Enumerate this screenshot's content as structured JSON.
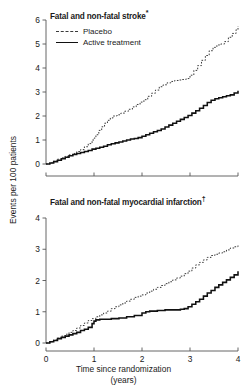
{
  "figure": {
    "y_axis_label": "Events per 100 patients",
    "x_axis_label_line1": "Time since randomization",
    "x_axis_label_line2": "(years)",
    "legend": {
      "placebo_label": "Placebo",
      "active_label": "Active treatment"
    },
    "colors": {
      "placebo": "#3a3a3a",
      "active": "#111111",
      "axis": "#555555",
      "text": "#1a1a1a"
    }
  },
  "chart_data": [
    {
      "type": "line",
      "panel": "top",
      "title": "Fatal and non-fatal stroke*",
      "title_text": "Fatal and non-fatal stroke",
      "title_superscript": "*",
      "xlabel": "Time since randomization (years)",
      "ylabel": "Events per 100 patients",
      "xlim": [
        0,
        4
      ],
      "ylim": [
        0,
        6
      ],
      "xticks": [
        0,
        1,
        2,
        3,
        4
      ],
      "xticklabels": [
        "0",
        "1",
        "2",
        "3",
        "4"
      ],
      "yticks": [
        0,
        1,
        2,
        3,
        4,
        5,
        6
      ],
      "yticklabels": [
        "0",
        "1",
        "2",
        "3",
        "4",
        "5",
        "6"
      ],
      "grid": false,
      "legend_position": "top-left",
      "step_style": "post",
      "series": [
        {
          "name": "Placebo",
          "style": "dashed",
          "x": [
            0.0,
            0.08,
            0.16,
            0.24,
            0.32,
            0.4,
            0.48,
            0.56,
            0.64,
            0.72,
            0.8,
            0.88,
            0.96,
            1.0,
            1.04,
            1.1,
            1.16,
            1.22,
            1.28,
            1.34,
            1.4,
            1.48,
            1.56,
            1.64,
            1.72,
            1.8,
            1.88,
            1.96,
            2.04,
            2.12,
            2.2,
            2.28,
            2.36,
            2.44,
            2.52,
            2.6,
            2.68,
            2.76,
            2.84,
            2.92,
            3.0,
            3.08,
            3.16,
            3.24,
            3.32,
            3.4,
            3.48,
            3.56,
            3.64,
            3.72,
            3.8,
            3.88,
            3.96,
            4.0
          ],
          "y": [
            0.0,
            0.05,
            0.12,
            0.2,
            0.26,
            0.32,
            0.38,
            0.44,
            0.52,
            0.6,
            0.72,
            0.85,
            1.0,
            1.08,
            1.22,
            1.4,
            1.55,
            1.7,
            1.82,
            1.92,
            2.0,
            2.05,
            2.12,
            2.2,
            2.28,
            2.38,
            2.48,
            2.58,
            2.68,
            2.82,
            2.95,
            3.08,
            3.22,
            3.3,
            3.38,
            3.44,
            3.48,
            3.5,
            3.52,
            3.56,
            3.7,
            3.9,
            4.1,
            4.32,
            4.52,
            4.72,
            4.86,
            4.96,
            5.0,
            5.1,
            5.28,
            5.44,
            5.6,
            5.75
          ]
        },
        {
          "name": "Active treatment",
          "style": "solid",
          "x": [
            0.0,
            0.08,
            0.16,
            0.24,
            0.32,
            0.4,
            0.48,
            0.56,
            0.64,
            0.72,
            0.8,
            0.88,
            0.96,
            1.04,
            1.12,
            1.2,
            1.28,
            1.36,
            1.44,
            1.52,
            1.6,
            1.68,
            1.76,
            1.84,
            1.92,
            2.0,
            2.08,
            2.16,
            2.24,
            2.32,
            2.4,
            2.48,
            2.56,
            2.64,
            2.72,
            2.8,
            2.88,
            2.96,
            3.04,
            3.12,
            3.2,
            3.28,
            3.36,
            3.44,
            3.52,
            3.6,
            3.68,
            3.76,
            3.84,
            3.92,
            4.0
          ],
          "y": [
            0.0,
            0.04,
            0.1,
            0.16,
            0.22,
            0.28,
            0.34,
            0.4,
            0.44,
            0.48,
            0.52,
            0.56,
            0.62,
            0.66,
            0.7,
            0.74,
            0.8,
            0.84,
            0.88,
            0.92,
            0.96,
            1.0,
            1.04,
            1.06,
            1.1,
            1.16,
            1.22,
            1.28,
            1.34,
            1.4,
            1.46,
            1.54,
            1.62,
            1.7,
            1.78,
            1.86,
            1.94,
            2.02,
            2.12,
            2.22,
            2.32,
            2.44,
            2.56,
            2.66,
            2.72,
            2.76,
            2.8,
            2.84,
            2.88,
            2.96,
            3.05
          ]
        }
      ]
    },
    {
      "type": "line",
      "panel": "bottom",
      "title": "Fatal and non-fatal myocardial infarction†",
      "title_text": "Fatal and non-fatal myocardial infarction",
      "title_superscript": "†",
      "xlabel": "Time since randomization (years)",
      "ylabel": "Events per 100 patients",
      "xlim": [
        0,
        4
      ],
      "ylim": [
        0,
        4
      ],
      "xticks": [
        0,
        1,
        2,
        3,
        4
      ],
      "xticklabels": [
        "0",
        "1",
        "2",
        "3",
        "4"
      ],
      "yticks": [
        0,
        1,
        2,
        3,
        4
      ],
      "yticklabels": [
        "0",
        "1",
        "2",
        "3",
        "4"
      ],
      "grid": false,
      "legend_position": "none",
      "step_style": "post",
      "series": [
        {
          "name": "Placebo",
          "style": "dashed",
          "x": [
            0.0,
            0.08,
            0.16,
            0.24,
            0.32,
            0.4,
            0.48,
            0.56,
            0.64,
            0.72,
            0.8,
            0.88,
            0.96,
            1.04,
            1.12,
            1.2,
            1.28,
            1.36,
            1.44,
            1.52,
            1.6,
            1.68,
            1.76,
            1.84,
            1.92,
            2.0,
            2.08,
            2.16,
            2.24,
            2.32,
            2.4,
            2.48,
            2.56,
            2.64,
            2.72,
            2.8,
            2.88,
            2.96,
            3.04,
            3.12,
            3.2,
            3.28,
            3.36,
            3.44,
            3.52,
            3.6,
            3.68,
            3.76,
            3.84,
            3.92,
            4.0
          ],
          "y": [
            0.0,
            0.04,
            0.1,
            0.16,
            0.22,
            0.28,
            0.34,
            0.4,
            0.48,
            0.56,
            0.64,
            0.72,
            0.78,
            0.84,
            0.9,
            0.96,
            1.02,
            1.1,
            1.16,
            1.22,
            1.28,
            1.34,
            1.4,
            1.46,
            1.5,
            1.54,
            1.6,
            1.66,
            1.72,
            1.78,
            1.84,
            1.9,
            1.96,
            2.02,
            2.08,
            2.14,
            2.22,
            2.3,
            2.4,
            2.5,
            2.58,
            2.66,
            2.74,
            2.8,
            2.84,
            2.88,
            2.92,
            2.98,
            3.04,
            3.08,
            3.12
          ]
        },
        {
          "name": "Active treatment",
          "style": "solid",
          "x": [
            0.0,
            0.08,
            0.16,
            0.24,
            0.32,
            0.4,
            0.48,
            0.56,
            0.64,
            0.72,
            0.8,
            0.88,
            0.96,
            1.0,
            1.04,
            1.12,
            1.2,
            1.36,
            1.52,
            1.68,
            1.84,
            2.0,
            2.08,
            2.16,
            2.32,
            2.48,
            2.56,
            2.64,
            2.8,
            2.88,
            2.96,
            3.04,
            3.12,
            3.2,
            3.28,
            3.36,
            3.44,
            3.52,
            3.6,
            3.68,
            3.76,
            3.84,
            3.92,
            4.0
          ],
          "y": [
            0.0,
            0.04,
            0.08,
            0.14,
            0.18,
            0.22,
            0.26,
            0.3,
            0.34,
            0.4,
            0.44,
            0.5,
            0.62,
            0.7,
            0.74,
            0.76,
            0.76,
            0.78,
            0.8,
            0.84,
            0.88,
            0.96,
            1.0,
            1.02,
            1.04,
            1.06,
            1.06,
            1.06,
            1.08,
            1.1,
            1.16,
            1.24,
            1.32,
            1.4,
            1.5,
            1.6,
            1.68,
            1.78,
            1.86,
            1.94,
            2.02,
            2.1,
            2.18,
            2.3
          ]
        }
      ]
    }
  ]
}
